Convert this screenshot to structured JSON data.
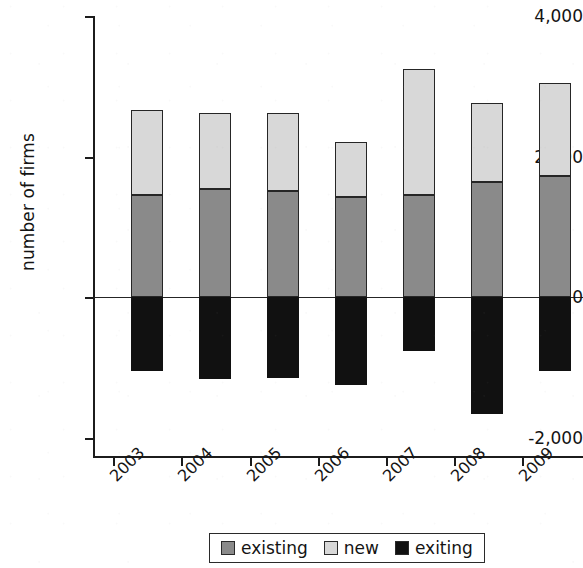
{
  "chart_data": {
    "type": "bar",
    "subtype": "stacked-bar-with-negative",
    "title": "",
    "xlabel": "",
    "ylabel": "number of firms",
    "categories": [
      "2003",
      "2004",
      "2005",
      "2006",
      "2007",
      "2008",
      "2009"
    ],
    "series": [
      {
        "name": "existing",
        "color": "#8a8a8a",
        "values": [
          1450,
          1530,
          1500,
          1420,
          1450,
          1630,
          1720
        ]
      },
      {
        "name": "new",
        "color": "#d8d8d8",
        "values": [
          1200,
          1080,
          1110,
          780,
          1780,
          1120,
          1320
        ]
      },
      {
        "name": "exiting",
        "color": "#111111",
        "values": [
          -1050,
          -1160,
          -1150,
          -1250,
          -770,
          -1660,
          -1050
        ]
      }
    ],
    "stacked_totals_positive": [
      2650,
      2610,
      2610,
      2200,
      3230,
      2750,
      3040
    ],
    "ylim": [
      -2400,
      4000
    ],
    "yticks": [
      4000,
      2000,
      0,
      -2000
    ],
    "ytick_labels": [
      "4,000",
      "2,000",
      "0",
      "-2,000"
    ],
    "grid": false,
    "zero_line": true,
    "legend_position": "bottom-center",
    "legend_entries": [
      "existing",
      "new",
      "exiting"
    ]
  },
  "axis": {
    "y_label": "number of firms",
    "y_ticks": [
      {
        "label": "4,000",
        "value": 4000,
        "top": 16
      },
      {
        "label": "2,000",
        "value": 2000,
        "top": 157
      },
      {
        "label": "0",
        "value": 0,
        "top": 297
      },
      {
        "label": "-2,000",
        "value": -2000,
        "top": 438
      }
    ],
    "x_ticks": [
      "2003",
      "2004",
      "2005",
      "2006",
      "2007",
      "2008",
      "2009"
    ]
  },
  "legend": {
    "items": [
      {
        "label": "existing",
        "color": "#8a8a8a"
      },
      {
        "label": "new",
        "color": "#d8d8d8"
      },
      {
        "label": "exiting",
        "color": "#111111"
      }
    ]
  }
}
